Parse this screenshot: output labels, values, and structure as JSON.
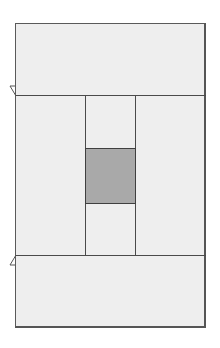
{
  "diagram": {
    "type": "panel-layout",
    "regions": [
      {
        "id": "top-panel",
        "x": 15,
        "y": 23,
        "w": 191,
        "h": 72
      },
      {
        "id": "middle-left",
        "x": 15,
        "y": 95,
        "w": 70,
        "h": 160
      },
      {
        "id": "middle-center",
        "x": 85,
        "y": 95,
        "w": 51,
        "h": 160
      },
      {
        "id": "middle-right",
        "x": 136,
        "y": 95,
        "w": 70,
        "h": 160
      },
      {
        "id": "highlight-square",
        "x": 85,
        "y": 148,
        "w": 51,
        "h": 56
      },
      {
        "id": "bottom-panel",
        "x": 15,
        "y": 255,
        "w": 191,
        "h": 73
      }
    ],
    "colors": {
      "panel_fill": "#eeeeee",
      "line": "#4a4a4a",
      "highlight_fill": "#a9a9a9"
    }
  }
}
